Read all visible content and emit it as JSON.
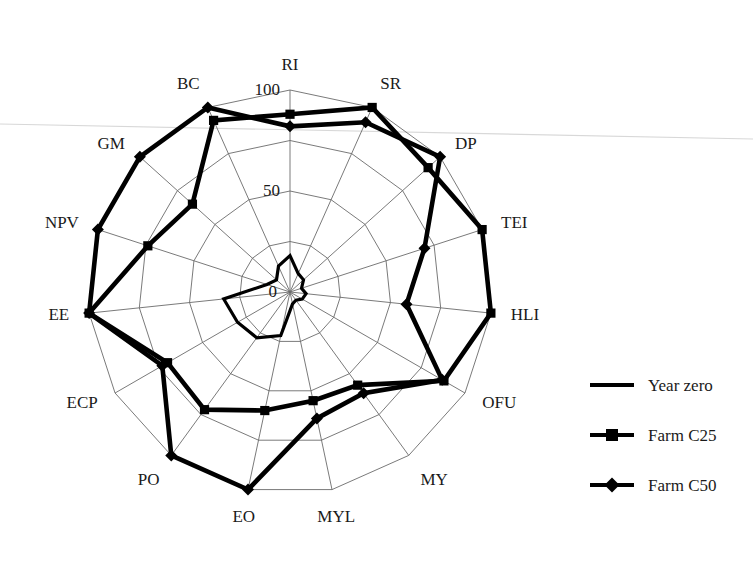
{
  "chart_data": {
    "type": "radar",
    "title": "",
    "subtitle": "",
    "xlabel": "",
    "ylabel": "",
    "grid": true,
    "rlim": [
      0,
      100
    ],
    "r_ticks": [
      0,
      50,
      100
    ],
    "r_tick_labels": [
      "0",
      "50",
      "100"
    ],
    "tick_axis": "RI",
    "legend_position": "right",
    "categories": [
      "RI",
      "SR",
      "DP",
      "TEI",
      "HLI",
      "OFU",
      "MY",
      "MYL",
      "EO",
      "PO",
      "ECP",
      "EE",
      "NPV",
      "GM",
      "BC"
    ],
    "series": [
      {
        "name": "Year zero",
        "marker": "none",
        "values": [
          18,
          10,
          9,
          6,
          8,
          7,
          5,
          6,
          22,
          28,
          30,
          33,
          12,
          9,
          14
        ]
      },
      {
        "name": "Farm C25",
        "marker": "square",
        "values": [
          88,
          100,
          92,
          100,
          100,
          88,
          57,
          55,
          60,
          72,
          70,
          100,
          74,
          65,
          93
        ]
      },
      {
        "name": "Farm C50",
        "marker": "diamond",
        "values": [
          82,
          92,
          100,
          70,
          58,
          87,
          62,
          64,
          100,
          100,
          73,
          100,
          100,
          100,
          100
        ]
      }
    ],
    "legend": [
      {
        "label": "Year zero",
        "marker": "none",
        "color": "#000000"
      },
      {
        "label": "Farm C25",
        "marker": "square",
        "color": "#000000"
      },
      {
        "label": "Farm C50",
        "marker": "diamond",
        "color": "#000000"
      }
    ],
    "colors": {
      "series": "#000000",
      "grid": "#6b6b6b",
      "text": "#1a1a1a",
      "background": "#ffffff"
    }
  },
  "chart_geometry": {
    "center_x": 290,
    "center_y": 292,
    "outer_radius": 202,
    "ring_count": 4,
    "start_angle_deg": -90,
    "direction": "clockwise"
  },
  "legend_panel": {
    "x": 590,
    "y": 385,
    "row_gap": 50,
    "swatch_width": 44
  }
}
